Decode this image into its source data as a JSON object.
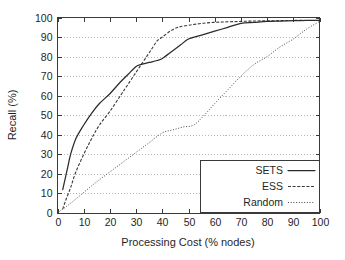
{
  "chart_data": {
    "type": "line",
    "title": "",
    "xlabel": "Processing Cost (% nodes)",
    "ylabel": "Recall (%)",
    "xlim": [
      0,
      100
    ],
    "ylim": [
      0,
      100
    ],
    "xticks": [
      "0",
      "10",
      "20",
      "30",
      "40",
      "50",
      "60",
      "70",
      "80",
      "90",
      "100"
    ],
    "yticks": [
      "0",
      "10",
      "20",
      "30",
      "40",
      "50",
      "60",
      "70",
      "80",
      "90",
      "100"
    ],
    "grid": "horizontal-dotted",
    "legend_position": "lower-right-inside",
    "series": [
      {
        "name": "SETS",
        "style": "solid",
        "color": "#2b2b2b",
        "x": [
          2,
          3,
          4,
          5,
          7,
          10,
          13,
          16,
          20,
          24,
          27,
          30,
          32,
          35,
          38,
          40,
          44,
          47,
          50,
          55,
          60,
          65,
          70,
          75,
          80,
          85,
          90,
          95,
          100
        ],
        "y": [
          12,
          18,
          24,
          30,
          38,
          45,
          51,
          56,
          61,
          67,
          71,
          75,
          76,
          77,
          78,
          79,
          83,
          86,
          89,
          91,
          93,
          95,
          97,
          97.5,
          98,
          98.2,
          98.4,
          98.5,
          98.5
        ]
      },
      {
        "name": "ESS",
        "style": "dashed",
        "color": "#3a3a3a",
        "x": [
          2,
          3,
          5,
          7,
          10,
          13,
          16,
          20,
          24,
          27,
          30,
          32,
          34,
          36,
          38,
          40,
          43,
          46,
          50,
          55,
          60,
          65,
          70,
          75,
          80,
          85,
          90,
          95,
          100
        ],
        "y": [
          2,
          6,
          13,
          21,
          30,
          38,
          45,
          52,
          60,
          66,
          72,
          76,
          80,
          84,
          88,
          90,
          93,
          95,
          96,
          97,
          97.5,
          97.8,
          98,
          98.2,
          98.3,
          98.4,
          98.5,
          98.5,
          98.5
        ]
      },
      {
        "name": "Random",
        "style": "dotted",
        "color": "#4a4a4a",
        "x": [
          0,
          5,
          10,
          15,
          20,
          25,
          30,
          35,
          40,
          44,
          48,
          52,
          56,
          60,
          65,
          70,
          75,
          80,
          85,
          90,
          95,
          100
        ],
        "y": [
          0,
          5,
          10.5,
          16,
          21,
          26,
          31,
          36,
          41,
          42.5,
          44,
          45,
          50,
          56,
          63,
          70,
          76,
          80,
          85,
          89,
          94,
          98
        ]
      }
    ]
  },
  "legend": {
    "items": [
      {
        "label": "SETS"
      },
      {
        "label": "ESS"
      },
      {
        "label": "Random"
      }
    ]
  }
}
